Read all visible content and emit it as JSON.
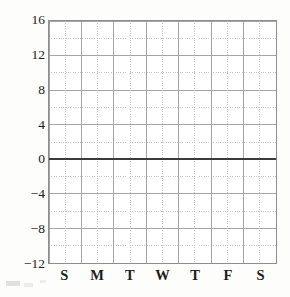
{
  "chart_data": {
    "type": "line",
    "title": "",
    "subtitle": "",
    "xlabel": "",
    "ylabel": "",
    "grid": true,
    "legend": null,
    "categories": [
      "S",
      "M",
      "T",
      "W",
      "T",
      "F",
      "S"
    ],
    "x": [
      0,
      1,
      2,
      3,
      4,
      5,
      6
    ],
    "xlim": [
      -0.5,
      6.5
    ],
    "ylim": [
      -12,
      16
    ],
    "y_ticks_major": [
      16,
      12,
      8,
      4,
      0,
      -4,
      -8,
      -12
    ],
    "y_tick_labels": [
      "16",
      "12",
      "8",
      "4",
      "0",
      "−4",
      "−8",
      "−12"
    ],
    "y_minor_step": 2,
    "x_minor_divisions": 2,
    "zero_line": 0,
    "series": [
      {
        "name": "",
        "values": [
          0,
          0,
          0,
          0,
          0,
          0,
          0
        ]
      }
    ],
    "annotations": [],
    "colors": {
      "background": "#fdfdfb",
      "plot_background": "#ffffff",
      "axis": "#8d8d8d",
      "major_grid": "#9a9a9a",
      "minor_grid": "#b8b8b8",
      "zero_line": "#3a3a3a",
      "text": "#1c1c1c"
    }
  },
  "axes": {
    "y_labels": [
      {
        "text": "16",
        "value": 16
      },
      {
        "text": "12",
        "value": 12
      },
      {
        "text": "8",
        "value": 8
      },
      {
        "text": "4",
        "value": 4
      },
      {
        "text": "0",
        "value": 0
      },
      {
        "text": "−4",
        "value": -4
      },
      {
        "text": "−8",
        "value": -8
      },
      {
        "text": "−12",
        "value": -12
      }
    ],
    "x_labels": [
      {
        "text": "S",
        "index": 0
      },
      {
        "text": "M",
        "index": 1
      },
      {
        "text": "T",
        "index": 2
      },
      {
        "text": "W",
        "index": 3
      },
      {
        "text": "T",
        "index": 4
      },
      {
        "text": "F",
        "index": 5
      },
      {
        "text": "S",
        "index": 6
      }
    ]
  }
}
